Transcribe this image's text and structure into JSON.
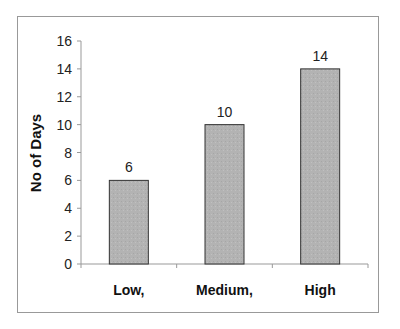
{
  "chart_data": {
    "type": "bar",
    "title": "",
    "xlabel": "",
    "ylabel": "No of Days",
    "categories": [
      "Low,",
      "Medium,",
      "High"
    ],
    "values": [
      6,
      10,
      14
    ],
    "data_labels": [
      "6",
      "10",
      "14"
    ],
    "ylim": [
      0,
      16
    ],
    "yticks": [
      0,
      2,
      4,
      6,
      8,
      10,
      12,
      14,
      16
    ],
    "grid": false,
    "legend": null,
    "bar_color": "#b3b3b3",
    "bar_edge_color": "#333333",
    "frame_color": "#999999"
  }
}
